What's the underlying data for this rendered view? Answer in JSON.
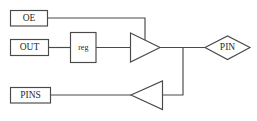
{
  "diagram": {
    "type": "block-diagram",
    "background_color": "#ffffff",
    "line_color": "#4a4a4a",
    "text_color": "#2a2a2a",
    "nodes": {
      "oe": {
        "label": "OE",
        "shape": "rect"
      },
      "out": {
        "label": "OUT",
        "shape": "rect"
      },
      "reg": {
        "label": "reg",
        "shape": "rect"
      },
      "pins": {
        "label": "PINS",
        "shape": "rect"
      },
      "pin": {
        "label": "PIN",
        "shape": "diamond"
      },
      "output_buffer": {
        "label": "",
        "shape": "triangle-right"
      },
      "input_buffer": {
        "label": "",
        "shape": "triangle-left"
      }
    }
  }
}
